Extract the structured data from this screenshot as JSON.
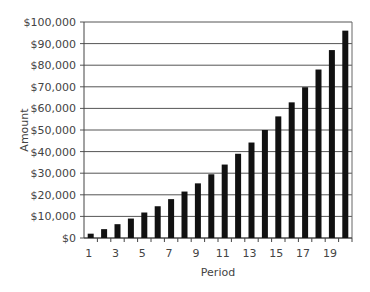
{
  "chart_data": {
    "type": "bar",
    "title": "",
    "xlabel": "Period",
    "ylabel": "Amount",
    "ylim": [
      0,
      100000
    ],
    "y_ticks": [
      "$0",
      "$10,000",
      "$20,000",
      "$30,000",
      "$40,000",
      "$50,000",
      "$60,000",
      "$70,000",
      "$80,000",
      "$90,000",
      "$100,000"
    ],
    "x_tick_labels": [
      "1",
      "3",
      "5",
      "7",
      "9",
      "11",
      "13",
      "15",
      "17",
      "19"
    ],
    "categories": [
      "1",
      "2",
      "3",
      "4",
      "5",
      "6",
      "7",
      "8",
      "9",
      "10",
      "11",
      "12",
      "13",
      "14",
      "15",
      "16",
      "17",
      "18",
      "19",
      "20"
    ],
    "values": [
      2000,
      4100,
      6400,
      9000,
      11800,
      14700,
      18000,
      21500,
      25300,
      29500,
      34000,
      39000,
      44200,
      50000,
      56300,
      62800,
      69800,
      78000,
      87000,
      96000
    ],
    "grid": true,
    "legend": null,
    "bar_color": "#111111",
    "grid_color": "#555555"
  }
}
